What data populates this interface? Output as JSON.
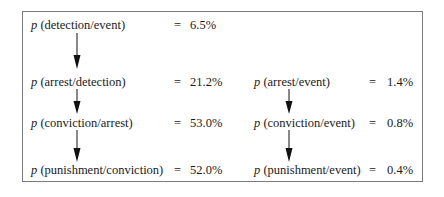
{
  "diagram": {
    "type": "probability-chain",
    "left_column": [
      {
        "symbol": "p",
        "label": "(detection/event)",
        "equals": "=",
        "value": "6.5%"
      },
      {
        "symbol": "p",
        "label": "(arrest/detection)",
        "equals": "=",
        "value": "21.2%"
      },
      {
        "symbol": "p",
        "label": "(conviction/arrest)",
        "equals": "=",
        "value": "53.0%"
      },
      {
        "symbol": "p",
        "label": "(punishment/conviction)",
        "equals": "=",
        "value": "52.0%"
      }
    ],
    "right_column": [
      {
        "symbol": "p",
        "label": "(arrest/event)",
        "equals": "=",
        "value": "1.4%"
      },
      {
        "symbol": "p",
        "label": "(conviction/event)",
        "equals": "=",
        "value": "0.8%"
      },
      {
        "symbol": "p",
        "label": "(punishment/event)",
        "equals": "=",
        "value": "0.4%"
      }
    ],
    "colors": {
      "border": "#7a7a7a",
      "text": "#1a1a1a",
      "arrow": "#111111"
    }
  }
}
